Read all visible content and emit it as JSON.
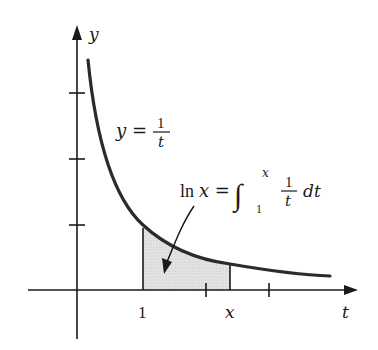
{
  "diagram": {
    "axes": {
      "x_axis_label": "t",
      "y_axis_label": "y",
      "x_tick_label_1": "1",
      "x_tick_label_x": "x",
      "y_ticks_count": 3,
      "x_ticks_count": 3
    },
    "curve": {
      "equation_lhs": "y =",
      "equation_numerator": "1",
      "equation_denominator": "t"
    },
    "shaded_region": {
      "label_lhs": "ln x =",
      "integral_sign": "∫",
      "upper_limit": "x",
      "lower_limit": "1",
      "integrand_numerator": "1",
      "integrand_denominator": "t",
      "differential": "dt",
      "from_t": 1,
      "to_t": 2.35,
      "fill_color": "#d9d9d9"
    },
    "colors": {
      "curve": "#2b2b2b",
      "axes": "#1a1a1a",
      "shading": "#d9d9d9"
    }
  }
}
